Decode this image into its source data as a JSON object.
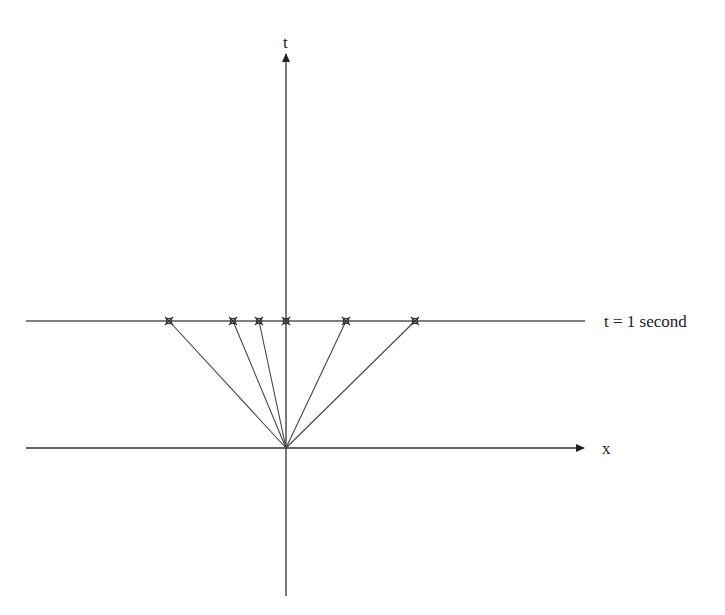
{
  "diagram": {
    "title_fragment": "(cropped text at top edge)",
    "axes": {
      "t_label": "t",
      "x_label": "x"
    },
    "line_label": "t = 1 second",
    "origin": {
      "x": 286,
      "y": 448
    },
    "t1_line_y": 321,
    "markers_x": [
      169,
      233,
      259,
      286,
      346,
      415
    ],
    "colors": {
      "line": "#555555",
      "axis": "#222222",
      "marker": "#444444"
    }
  }
}
